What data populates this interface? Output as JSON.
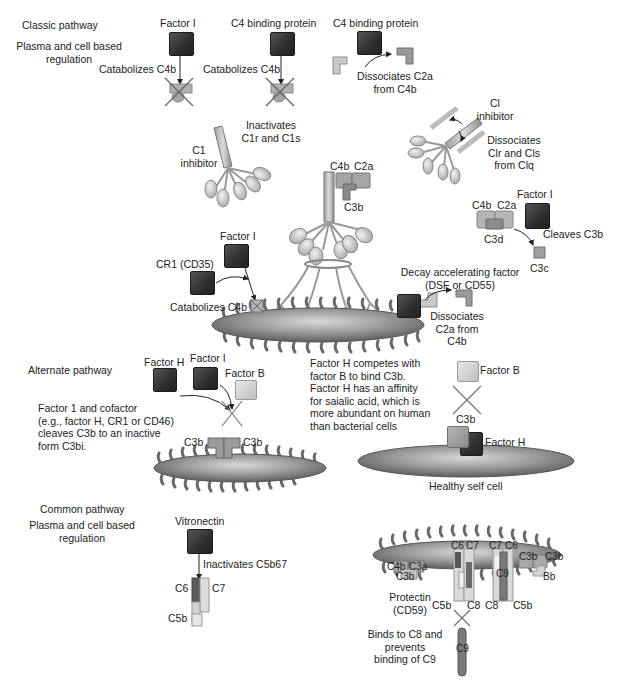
{
  "classic": {
    "title": "Classic pathway",
    "subtitle_line1": "Plasma and cell based",
    "subtitle_line2": "regulation",
    "factor_i_1": "Factor I",
    "catabolizes_1": "Catabolizes C4b",
    "c4bp_1": "C4 binding protein",
    "catabolizes_2": "Catabolizes C4b",
    "c4bp_2": "C4 binding protein",
    "dissociates_c2a_1": "Dissociates C2a",
    "dissociates_c2a_2": "from C4b",
    "c1_inh_label_1": "C1",
    "c1_inh_label_2": "inhibitor",
    "inactivates_1": "Inactivates",
    "inactivates_2": "C1r and C1s",
    "ci_inh_label_1": "Cl",
    "ci_inh_label_2": "inhibitor",
    "dissoc_clr_1": "Dissociates",
    "dissoc_clr_2": "Clr and Cls",
    "dissoc_clr_3": "from Clq",
    "c4b": "C4b",
    "c2a": "C2a",
    "c3b": "C3b",
    "factor_i_r": "Factor I",
    "c4b_r": "C4b",
    "c2a_r": "C2a",
    "c3d": "C3d",
    "cleaves_c3b": "Cleaves C3b",
    "c3c": "C3c",
    "factor_i_cr1": "Factor I",
    "cr1": "CR1 (CD35)",
    "catabolizes_3": "Catabolizes C4b",
    "daf_1": "Decay accelerating factor",
    "daf_2": "(DSF or CD55)",
    "dissoc_c2a_b1": "Dissociates",
    "dissoc_c2a_b2": "C2a from",
    "dissoc_c2a_b3": "C4b"
  },
  "alternate": {
    "title": "Alternate pathway",
    "factor_h": "Factor H",
    "factor_i": "Factor I",
    "factor_b": "Factor B",
    "desc_1": "Factor 1 and cofactor",
    "desc_2": "(e.g., factor H, CR1 or CD46)",
    "desc_3": "cleaves C3b to an inactive",
    "desc_4": "form C3bi.",
    "c3b_left": "C3b",
    "c3b_right": "C3b",
    "compete_1": "Factor H competes with",
    "compete_2": "factor B to bind C3b.",
    "compete_3": "Factor H has an affinity",
    "compete_4": "for saialic acid, which is",
    "compete_5": "more abundant on human",
    "compete_6": "than bacterial cells",
    "factor_b_r": "Factor B",
    "c3b_r": "C3b",
    "factor_h_r": "Factor H",
    "healthy_cell": "Healthy self cell"
  },
  "common": {
    "title": "Common pathway",
    "subtitle_line1": "Plasma and cell based",
    "subtitle_line2": "regulation",
    "vitronectin": "Vitronectin",
    "inactivates": "Inactivates C5b67",
    "c6": "C6",
    "c7": "C7",
    "c5b": "C5b",
    "mac": {
      "c6a": "C6",
      "c7a": "C7",
      "c7b": "C7",
      "c6b": "C6",
      "c4b": "C4b",
      "c3a": "C3a",
      "c3b_low": "C3b",
      "c3b_1": "C3b",
      "c3b_2": "C3b",
      "bb": "Bb",
      "c9_in": "C9",
      "c5b_l": "C5b",
      "c8_l": "C8",
      "c8_r": "C8",
      "c5b_r": "C5b",
      "protectin_1": "Protectin",
      "protectin_2": "(CD59)",
      "binds_1": "Binds to C8 and",
      "binds_2": "prevents",
      "binds_3": "binding of C9",
      "c9_free": "C9"
    }
  },
  "colors": {
    "dark_protein": "#333333",
    "light_protein": "#c8c8c8",
    "membrane": "#8c8c8c",
    "background": "#ffffff"
  }
}
